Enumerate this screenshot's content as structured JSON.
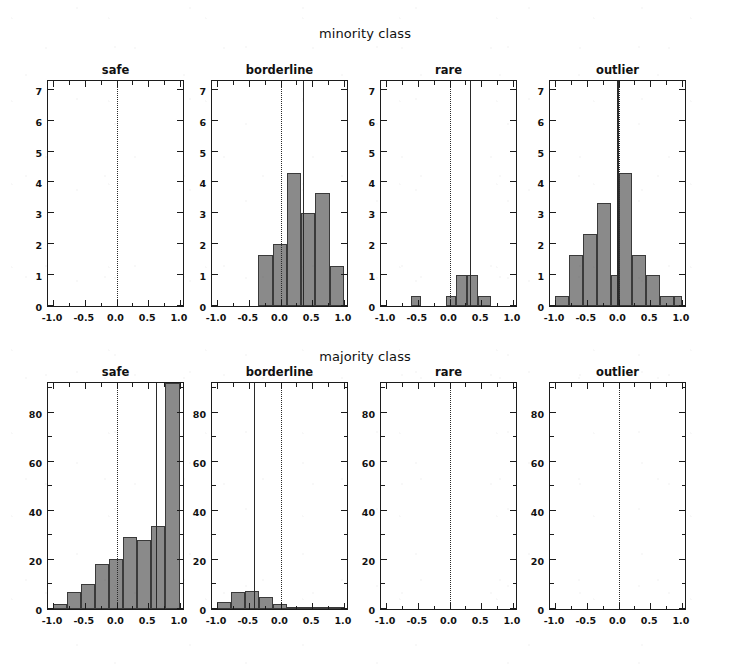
{
  "figure": {
    "width": 730,
    "height": 672,
    "background": "#ffffff",
    "bar_fill": "#8a8a8a",
    "bar_edge": "#3a3a3a",
    "axis_color": "#1c1c1c",
    "line_color": "#2a2a2a"
  },
  "rows": [
    {
      "title": "minority class"
    },
    {
      "title": "majority class"
    }
  ],
  "panel_titles": [
    "safe",
    "borderline",
    "rare",
    "outlier"
  ],
  "axis": {
    "x_ticks": [
      -1.0,
      -0.5,
      0.0,
      0.5,
      1.0
    ],
    "x_tick_labels": [
      "-1.0",
      "-0.5",
      "0.0",
      "0.5",
      "1.0"
    ],
    "x_minor_ticks": [
      -0.75,
      -0.25,
      0.25,
      0.75
    ],
    "xlim": [
      -1.08,
      1.08
    ],
    "minority_y_ticks": [
      0,
      1,
      2,
      3,
      4,
      5,
      6,
      7
    ],
    "minority_y_tick_labels": [
      "0",
      "1",
      "2",
      "3",
      "4",
      "5",
      "6",
      "7"
    ],
    "minority_ylim": [
      0,
      7.35
    ],
    "majority_y_ticks": [
      0,
      20,
      40,
      60,
      80
    ],
    "majority_y_tick_labels": [
      "0",
      "20",
      "40",
      "60",
      "80"
    ],
    "majority_y_minor_ticks": [
      10,
      30,
      50,
      70,
      90
    ],
    "majority_ylim": [
      0,
      93
    ]
  },
  "chart_data": {
    "type": "bar",
    "subtitle": "",
    "xlabel": "",
    "ylabel": "",
    "grid": false,
    "legend": "none",
    "layout": "2 rows x 4 columns of histogram panels",
    "panels": [
      {
        "row": "minority class",
        "name": "safe",
        "xlim": [
          -1.08,
          1.08
        ],
        "ylim": [
          0,
          7.35
        ],
        "bin_edges": [],
        "values": [],
        "dotted_vline": 0.0,
        "solid_vline": null,
        "note": "empty panel"
      },
      {
        "row": "minority class",
        "name": "borderline",
        "xlim": [
          -1.08,
          1.08
        ],
        "ylim": [
          0,
          7.35
        ],
        "bin_edges": [
          -0.35,
          -0.125,
          0.1,
          0.325,
          0.55,
          0.775,
          1.0
        ],
        "values": [
          1.65,
          2.0,
          4.3,
          3.0,
          3.65,
          1.3
        ],
        "dotted_vline": 0.0,
        "solid_vline": 0.35
      },
      {
        "row": "minority class",
        "name": "rare",
        "xlim": [
          -1.08,
          1.08
        ],
        "ylim": [
          0,
          7.35
        ],
        "bin_edges": [
          -0.6,
          -0.45,
          -0.05,
          0.1,
          0.28,
          0.45,
          0.65
        ],
        "values": [
          0.33,
          0.0,
          0.33,
          1.0,
          1.0,
          0.33
        ],
        "dotted_vline": 0.0,
        "solid_vline": 0.32
      },
      {
        "row": "minority class",
        "name": "outlier",
        "xlim": [
          -1.08,
          1.08
        ],
        "ylim": [
          0,
          7.35
        ],
        "bin_edges": [
          -1.0,
          -0.78,
          -0.56,
          -0.34,
          -0.12,
          0.0,
          0.22,
          0.44,
          0.66,
          0.88,
          1.0
        ],
        "values": [
          0.33,
          1.65,
          2.33,
          3.33,
          1.0,
          4.3,
          1.65,
          1.0,
          0.33,
          0.33
        ],
        "dotted_vline": 0.0,
        "solid_vline": -0.02
      },
      {
        "row": "majority class",
        "name": "safe",
        "xlim": [
          -1.08,
          1.08
        ],
        "ylim": [
          0,
          93
        ],
        "bin_edges": [
          -1.0,
          -0.78,
          -0.56,
          -0.34,
          -0.12,
          0.1,
          0.32,
          0.54,
          0.76,
          1.0
        ],
        "values": [
          2,
          7,
          10,
          18.5,
          20.5,
          29.5,
          28,
          34,
          92
        ],
        "dotted_vline": 0.0,
        "solid_vline": 0.62
      },
      {
        "row": "majority class",
        "name": "borderline",
        "xlim": [
          -1.08,
          1.08
        ],
        "ylim": [
          0,
          93
        ],
        "bin_edges": [
          -1.0,
          -0.78,
          -0.56,
          -0.34,
          -0.12,
          0.1,
          0.32,
          0.54,
          0.76,
          1.0
        ],
        "values": [
          3,
          7,
          7.5,
          5,
          2,
          1,
          1,
          0.7,
          0.4
        ],
        "dotted_vline": 0.0,
        "solid_vline": -0.42
      },
      {
        "row": "majority class",
        "name": "rare",
        "xlim": [
          -1.08,
          1.08
        ],
        "ylim": [
          0,
          93
        ],
        "bin_edges": [],
        "values": [],
        "dotted_vline": 0.0,
        "solid_vline": null,
        "note": "empty panel"
      },
      {
        "row": "majority class",
        "name": "outlier",
        "xlim": [
          -1.08,
          1.08
        ],
        "ylim": [
          0,
          93
        ],
        "bin_edges": [],
        "values": [],
        "dotted_vline": 0.0,
        "solid_vline": null,
        "note": "empty panel"
      }
    ]
  }
}
